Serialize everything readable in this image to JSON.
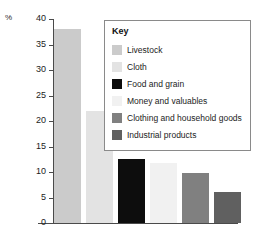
{
  "chart_data": {
    "type": "bar",
    "title": "",
    "xlabel": "",
    "ylabel": "%",
    "ylim": [
      0,
      40
    ],
    "yticks": [
      0,
      5,
      10,
      15,
      20,
      25,
      30,
      35,
      40
    ],
    "grid": false,
    "legend_position": "inside-top-right",
    "categories": [
      "Livestock",
      "Cloth",
      "Food and grain",
      "Money and valuables",
      "Clothing and household goods",
      "Industrial products"
    ],
    "values": [
      38,
      22,
      12.5,
      11.8,
      9.8,
      6.1
    ],
    "colors": [
      "#cbcbcb",
      "#e3e3e3",
      "#0d0d0d",
      "#f1f1f1",
      "#808080",
      "#606060"
    ]
  },
  "axis": {
    "percent_symbol": "%",
    "tick_labels": [
      "40",
      "35",
      "30",
      "25",
      "20",
      "15",
      "10",
      "5",
      "0"
    ]
  },
  "legend": {
    "title": "Key",
    "items": [
      {
        "label": "Livestock",
        "color": "#cbcbcb"
      },
      {
        "label": "Cloth",
        "color": "#e3e3e3"
      },
      {
        "label": "Food and grain",
        "color": "#0d0d0d"
      },
      {
        "label": "Money and valuables",
        "color": "#f1f1f1"
      },
      {
        "label": "Clothing and household goods",
        "color": "#808080"
      },
      {
        "label": "Industrial products",
        "color": "#606060"
      }
    ]
  }
}
